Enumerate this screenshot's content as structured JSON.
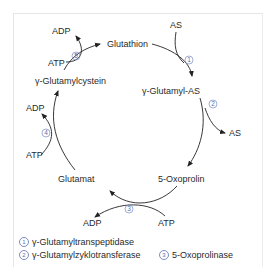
{
  "diagram": {
    "nodes": {
      "glutathion": "Glutathion",
      "gamma_glutamyl_as": "γ-Glutamyl-AS",
      "oxoprolin": "5-Oxoprolin",
      "glutamat": "Glutamat",
      "gamma_glutamylcystein": "γ-Glutamylcystein"
    },
    "side_labels": {
      "as_in": "AS",
      "as_out": "AS",
      "adp_3": "ADP",
      "atp_3": "ATP",
      "adp_4": "ADP",
      "atp_4": "ATP",
      "adp_5": "ADP",
      "atp_5": "ATP"
    },
    "step_numbers": {
      "s1": "1",
      "s2": "2",
      "s3": "3",
      "s4": "4",
      "s5": "5"
    }
  },
  "legend": {
    "items": [
      {
        "num": "1",
        "label": "γ-Glutamyltranspeptidase"
      },
      {
        "num": "2",
        "label": "γ-Glutamylzyklotransferase"
      },
      {
        "num": "3",
        "label": "5-Oxoprolinase"
      }
    ]
  },
  "colors": {
    "step_number": "#5a6fb0",
    "arrow": "#222222",
    "border": "#e6e6e6"
  }
}
